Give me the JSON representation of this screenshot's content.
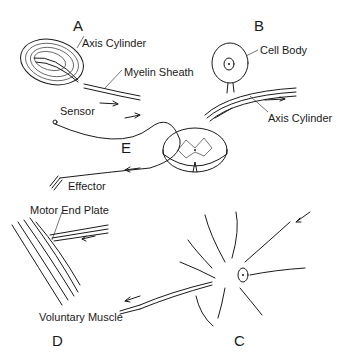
{
  "figure": {
    "panels": [
      {
        "id": "A",
        "letter": "A",
        "labels": [
          "Axis Cylinder",
          "Myelin Sheath"
        ]
      },
      {
        "id": "B",
        "letter": "B",
        "labels": [
          "Cell Body",
          "Axis Cylinder"
        ]
      },
      {
        "id": "C",
        "letter": "C",
        "labels": []
      },
      {
        "id": "D",
        "letter": "D",
        "labels": [
          "Motor End Plate",
          "Voluntary Muscle"
        ]
      },
      {
        "id": "E",
        "letter": "E",
        "labels": [
          "Sensor",
          "Effector"
        ]
      }
    ]
  },
  "colors": {
    "ink": "#1a1a1a",
    "background": "#ffffff"
  }
}
